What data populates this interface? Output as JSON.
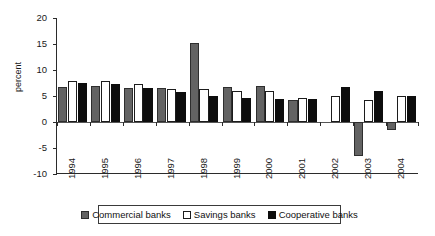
{
  "chart_data": {
    "type": "bar",
    "title": "",
    "xlabel": "",
    "ylabel": "percent",
    "ylim": [
      -10,
      20
    ],
    "yticks": [
      20,
      15,
      10,
      5,
      0,
      -5,
      -10
    ],
    "ytick_labels": [
      "20",
      "15",
      "10",
      "5",
      "0",
      "-5",
      "-10"
    ],
    "grid": false,
    "legend_position": "bottom",
    "categories": [
      "1994",
      "1995",
      "1996",
      "1997",
      "1998",
      "1999",
      "2000",
      "2001",
      "2002",
      "2003",
      "2004"
    ],
    "series": [
      {
        "name": "Commercial banks",
        "color": "#636363",
        "values": [
          6.8,
          6.9,
          6.6,
          6.6,
          15.2,
          6.8,
          7.0,
          4.2,
          0.0,
          -6.6,
          -1.5
        ]
      },
      {
        "name": "Savings banks",
        "color": "#ffffff",
        "values": [
          7.8,
          7.9,
          7.4,
          6.3,
          6.4,
          5.9,
          5.9,
          4.6,
          5.0,
          4.2,
          5.0
        ]
      },
      {
        "name": "Cooperative banks",
        "color": "#0d0d0d",
        "values": [
          7.5,
          7.3,
          6.5,
          5.8,
          5.0,
          4.6,
          4.4,
          4.4,
          6.7,
          6.0,
          5.0
        ]
      }
    ]
  },
  "axis": {
    "y_title": "percent"
  },
  "legend": {
    "items": [
      {
        "label": "Commercial banks",
        "swatch": "commercial-swatch"
      },
      {
        "label": "Savings banks",
        "swatch": "savings-swatch"
      },
      {
        "label": "Cooperative banks",
        "swatch": "cooperative-swatch"
      }
    ]
  }
}
